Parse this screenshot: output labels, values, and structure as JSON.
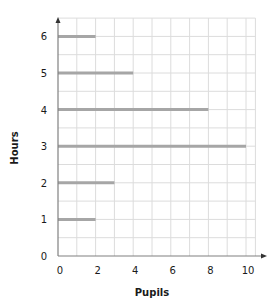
{
  "chart_data": {
    "type": "bar",
    "orientation": "horizontal",
    "title": "",
    "xlabel": "Pupils",
    "ylabel": "Hours",
    "categories": [
      "1",
      "2",
      "3",
      "4",
      "5",
      "6"
    ],
    "values": [
      2,
      3,
      10,
      8,
      4,
      2
    ],
    "xlim": [
      0,
      10.5
    ],
    "ylim": [
      0,
      6.5
    ],
    "x_ticks": [
      "0",
      "2",
      "4",
      "6",
      "8",
      "10"
    ],
    "y_ticks": [
      "0",
      "1",
      "2",
      "3",
      "4",
      "5",
      "6"
    ],
    "grid": true,
    "legend": null,
    "bar_color": "#a6a6a6",
    "grid_color": "#dcdcdc",
    "axis_color": "#808080"
  }
}
